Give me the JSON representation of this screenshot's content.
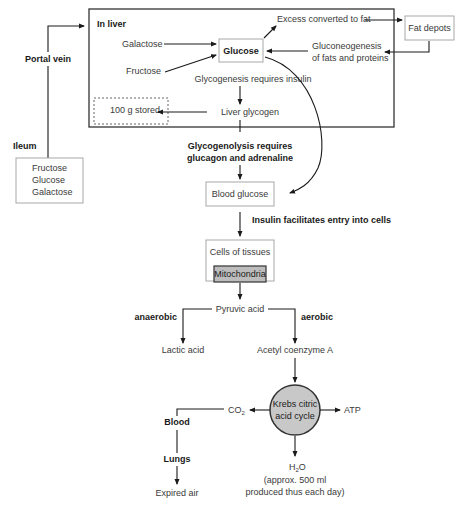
{
  "diagram": {
    "liver": {
      "title": "In liver",
      "galactose": "Galactose",
      "fructose": "Fructose",
      "glucose": "Glucose",
      "excess": "Excess converted to fat",
      "gluconeo_line1": "Gluconeogenesis",
      "gluconeo_line2": "of fats and proteins",
      "glycogenesis": "Glycogenesis requires insulin",
      "liver_glycogen": "Liver glycogen",
      "stored": "100 g stored"
    },
    "fat_depots": "Fat depots",
    "portal_vein": "Portal vein",
    "ileum": {
      "label": "Ileum",
      "items": [
        "Fructose",
        "Glucose",
        "Galactose"
      ]
    },
    "glycogenolysis_line1": "Glycogenolysis requires",
    "glycogenolysis_line2": "glucagon and adrenaline",
    "blood_glucose": "Blood glucose",
    "insulin": "Insulin facilitates entry into cells",
    "cells_of_tissues": "Cells of tissues",
    "mitochondria": "Mitochondria",
    "pyruvic_acid": "Pyruvic acid",
    "anaerobic": "anaerobic",
    "aerobic": "aerobic",
    "lactic_acid": "Lactic acid",
    "acetyl_coa": "Acetyl coenzyme A",
    "krebs_line1": "Krebs citric",
    "krebs_line2": "acid cycle",
    "co2": "CO",
    "co2_sub": "2",
    "atp": "ATP",
    "blood": "Blood",
    "lungs": "Lungs",
    "expired_air": "Expired air",
    "h2o_h": "H",
    "h2o_sub": "2",
    "h2o_o": "O",
    "h2o_note_line1": "(approx. 500 ml",
    "h2o_note_line2": "produced thus each day)"
  }
}
